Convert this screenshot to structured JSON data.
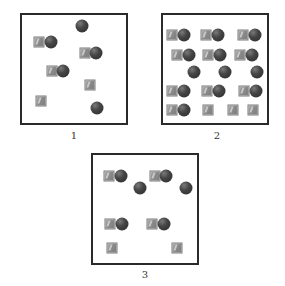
{
  "figure": {
    "panels": [
      {
        "id": "panel-1",
        "label": "1",
        "box": {
          "x": 20,
          "y": 13,
          "w": 108,
          "h": 112
        },
        "label_pos": {
          "x": 74,
          "y": 130
        },
        "items": [
          {
            "type": "circle",
            "x": 82,
            "y": 26
          },
          {
            "type": "square",
            "x": 39,
            "y": 42
          },
          {
            "type": "circle",
            "x": 51,
            "y": 42
          },
          {
            "type": "square",
            "x": 85,
            "y": 53
          },
          {
            "type": "circle",
            "x": 96,
            "y": 53
          },
          {
            "type": "square",
            "x": 52,
            "y": 71
          },
          {
            "type": "circle",
            "x": 63,
            "y": 71
          },
          {
            "type": "square",
            "x": 90,
            "y": 85
          },
          {
            "type": "square",
            "x": 41,
            "y": 101
          },
          {
            "type": "circle",
            "x": 97,
            "y": 108
          }
        ]
      },
      {
        "id": "panel-2",
        "label": "2",
        "box": {
          "x": 161,
          "y": 13,
          "w": 108,
          "h": 112
        },
        "label_pos": {
          "x": 217,
          "y": 130
        },
        "items": [
          {
            "type": "square",
            "x": 172,
            "y": 35
          },
          {
            "type": "circle",
            "x": 184,
            "y": 35
          },
          {
            "type": "square",
            "x": 206,
            "y": 35
          },
          {
            "type": "circle",
            "x": 218,
            "y": 35
          },
          {
            "type": "square",
            "x": 243,
            "y": 35
          },
          {
            "type": "circle",
            "x": 255,
            "y": 35
          },
          {
            "type": "square",
            "x": 177,
            "y": 55
          },
          {
            "type": "circle",
            "x": 189,
            "y": 55
          },
          {
            "type": "square",
            "x": 208,
            "y": 55
          },
          {
            "type": "circle",
            "x": 220,
            "y": 55
          },
          {
            "type": "square",
            "x": 240,
            "y": 55
          },
          {
            "type": "circle",
            "x": 252,
            "y": 55
          },
          {
            "type": "circle",
            "x": 194,
            "y": 72
          },
          {
            "type": "circle",
            "x": 225,
            "y": 72
          },
          {
            "type": "circle",
            "x": 257,
            "y": 72
          },
          {
            "type": "square",
            "x": 172,
            "y": 91
          },
          {
            "type": "circle",
            "x": 184,
            "y": 91
          },
          {
            "type": "square",
            "x": 207,
            "y": 91
          },
          {
            "type": "circle",
            "x": 219,
            "y": 91
          },
          {
            "type": "square",
            "x": 244,
            "y": 91
          },
          {
            "type": "circle",
            "x": 256,
            "y": 91
          },
          {
            "type": "square",
            "x": 172,
            "y": 110
          },
          {
            "type": "circle",
            "x": 184,
            "y": 110
          },
          {
            "type": "square",
            "x": 208,
            "y": 110
          },
          {
            "type": "square",
            "x": 233,
            "y": 110
          },
          {
            "type": "square",
            "x": 253,
            "y": 110
          }
        ]
      },
      {
        "id": "panel-3",
        "label": "3",
        "box": {
          "x": 91,
          "y": 153,
          "w": 108,
          "h": 112
        },
        "label_pos": {
          "x": 145,
          "y": 269
        },
        "items": [
          {
            "type": "square",
            "x": 109,
            "y": 176
          },
          {
            "type": "circle",
            "x": 121,
            "y": 176
          },
          {
            "type": "square",
            "x": 155,
            "y": 176
          },
          {
            "type": "circle",
            "x": 166,
            "y": 176
          },
          {
            "type": "circle",
            "x": 140,
            "y": 188
          },
          {
            "type": "circle",
            "x": 186,
            "y": 188
          },
          {
            "type": "square",
            "x": 110,
            "y": 224
          },
          {
            "type": "circle",
            "x": 122,
            "y": 224
          },
          {
            "type": "square",
            "x": 152,
            "y": 224
          },
          {
            "type": "circle",
            "x": 164,
            "y": 224
          },
          {
            "type": "square",
            "x": 112,
            "y": 248
          },
          {
            "type": "square",
            "x": 177,
            "y": 248
          }
        ]
      }
    ],
    "legend_semantics": {
      "square": "gray-square-particle",
      "circle": "dark-sphere-particle"
    },
    "colors": {
      "square": "#8d8d8d",
      "circle": "#333333",
      "border": "#2a2a2a",
      "label": "#333333"
    }
  }
}
